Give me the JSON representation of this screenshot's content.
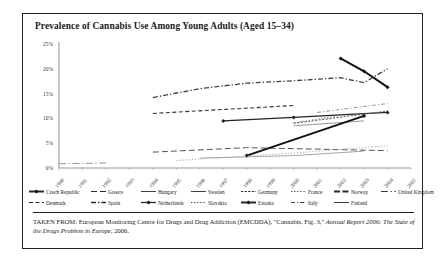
{
  "figure": {
    "title": "Prevalence of Cannabis Use Among Young Adults (Aged 15–34)",
    "caption_prefix": "TAKEN FROM: European Monitoring Centre for Drugs and Drug Addiction (EMCDDA), \"Cannabis, Fig. 3,\" ",
    "caption_italic": "Annual Report 2006: The State of the Drugs Problem in Europe",
    "caption_suffix": ", 2006."
  },
  "chart_data": {
    "type": "line",
    "title": "Prevalence of Cannabis Use Among Young Adults (Aged 15–34)",
    "xlabel": "",
    "ylabel": "",
    "ylim": [
      0,
      25
    ],
    "yticks": [
      "0%",
      "5%",
      "10%",
      "15%",
      "20%",
      "25%"
    ],
    "grid": false,
    "legend_position": "bottom",
    "x": [
      "1990",
      "1991",
      "1992",
      "1993",
      "1994",
      "1995",
      "1996",
      "1997",
      "1998",
      "1999",
      "2000",
      "2001",
      "2002",
      "2003",
      "2004",
      "2005"
    ],
    "categories": [
      "1990",
      "1991",
      "1992",
      "1993",
      "1994",
      "1995",
      "1996",
      "1997",
      "1998",
      "1999",
      "2000",
      "2001",
      "2002",
      "2003",
      "2004",
      "2005"
    ],
    "series": [
      {
        "name": "Czech Republic",
        "color": "#111111",
        "style": "solid-thick-marker",
        "values": [
          null,
          null,
          null,
          null,
          null,
          null,
          null,
          null,
          null,
          null,
          null,
          null,
          22.1,
          19.5,
          16.3,
          null
        ]
      },
      {
        "name": "Denmark",
        "color": "#333333",
        "style": "dashed",
        "values": [
          null,
          null,
          null,
          null,
          11.0,
          null,
          null,
          null,
          null,
          null,
          12.6,
          null,
          null,
          null,
          null,
          null
        ]
      },
      {
        "name": "Greece",
        "color": "#555555",
        "style": "dashed-long",
        "values": [
          null,
          null,
          null,
          null,
          3.2,
          null,
          null,
          null,
          4.1,
          null,
          null,
          null,
          null,
          null,
          3.5,
          null
        ]
      },
      {
        "name": "Spain",
        "color": "#444444",
        "style": "dash-dot",
        "values": [
          null,
          null,
          null,
          null,
          14.2,
          null,
          16.0,
          null,
          17.1,
          null,
          17.6,
          null,
          18.2,
          17.2,
          20.0,
          null
        ]
      },
      {
        "name": "Hungary",
        "color": "#8c8c8c",
        "style": "solid-thin",
        "values": [
          null,
          null,
          null,
          null,
          null,
          null,
          null,
          null,
          null,
          null,
          8.5,
          null,
          null,
          9.5,
          null,
          null
        ]
      },
      {
        "name": "Netherlands",
        "color": "#222222",
        "style": "solid-marker",
        "values": [
          null,
          null,
          null,
          null,
          null,
          null,
          null,
          9.5,
          null,
          null,
          10.2,
          null,
          null,
          null,
          11.2,
          null
        ]
      },
      {
        "name": "Sweden",
        "color": "#9a9a9a",
        "style": "solid-thin",
        "values": [
          null,
          null,
          null,
          null,
          null,
          null,
          2.0,
          null,
          null,
          null,
          2.5,
          null,
          null,
          3.4,
          null,
          null
        ]
      },
      {
        "name": "Slovakia",
        "color": "#777777",
        "style": "dotted",
        "values": [
          null,
          null,
          null,
          null,
          null,
          null,
          null,
          null,
          null,
          null,
          null,
          null,
          10.6,
          null,
          null,
          null
        ]
      },
      {
        "name": "Germany",
        "color": "#666666",
        "style": "dotted-dense",
        "values": [
          null,
          null,
          null,
          null,
          null,
          null,
          null,
          null,
          null,
          null,
          9.0,
          null,
          null,
          null,
          11.5,
          null
        ]
      },
      {
        "name": "Estonia",
        "color": "#111111",
        "style": "solid-thick-marker",
        "values": [
          null,
          null,
          null,
          null,
          null,
          null,
          null,
          null,
          2.5,
          null,
          null,
          null,
          null,
          10.5,
          null,
          null
        ]
      },
      {
        "name": "France",
        "color": "#a5a5a5",
        "style": "dotted",
        "values": [
          null,
          null,
          null,
          null,
          null,
          1.5,
          null,
          null,
          null,
          null,
          3.0,
          null,
          null,
          null,
          4.5,
          null
        ]
      },
      {
        "name": "Italy",
        "color": "#888888",
        "style": "dash-dot-thin",
        "values": [
          null,
          null,
          null,
          null,
          null,
          null,
          null,
          null,
          null,
          null,
          null,
          11.2,
          null,
          null,
          13.0,
          null
        ]
      },
      {
        "name": "Norway",
        "color": "#1a1a1a",
        "style": "dashed-thick",
        "values": [
          null,
          null,
          null,
          null,
          null,
          null,
          null,
          null,
          null,
          null,
          null,
          null,
          null,
          null,
          null,
          null
        ]
      },
      {
        "name": "Finland",
        "color": "#9e9e9e",
        "style": "solid-thin",
        "values": [
          null,
          null,
          null,
          null,
          null,
          null,
          null,
          null,
          null,
          null,
          null,
          null,
          null,
          null,
          null,
          null
        ]
      },
      {
        "name": "United Kingdom",
        "color": "#8a8a8a",
        "style": "dash-dot-long",
        "values": [
          null,
          null,
          1.0,
          null,
          null,
          null,
          null,
          null,
          null,
          null,
          null,
          null,
          null,
          null,
          null,
          null
        ]
      }
    ],
    "legend": [
      {
        "label": "Czech Republic",
        "key": "solid-thick-marker"
      },
      {
        "label": "Greece",
        "key": "dashed-long"
      },
      {
        "label": "Hungary",
        "key": "solid-thin"
      },
      {
        "label": "Sweden",
        "key": "solid-thin"
      },
      {
        "label": "Germany",
        "key": "dotted-dense"
      },
      {
        "label": "France",
        "key": "dotted"
      },
      {
        "label": "Norway",
        "key": "dashed-thick"
      },
      {
        "label": "United Kingdom",
        "key": "dash-dot-long"
      },
      {
        "label": "Denmark",
        "key": "dashed"
      },
      {
        "label": "Spain",
        "key": "dash-dot"
      },
      {
        "label": "Netherlands",
        "key": "solid-marker"
      },
      {
        "label": "Slovakia",
        "key": "dotted"
      },
      {
        "label": "Estonia",
        "key": "solid-thick-marker"
      },
      {
        "label": "Italy",
        "key": "dash-dot-thin"
      },
      {
        "label": "Finland",
        "key": "solid-thin"
      }
    ]
  }
}
